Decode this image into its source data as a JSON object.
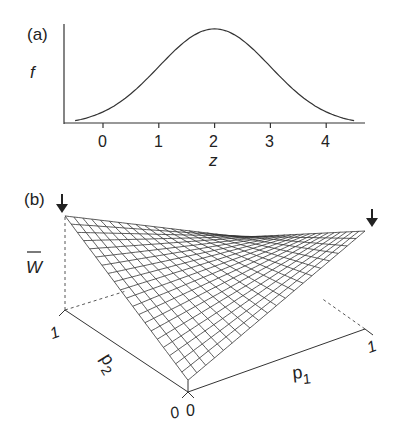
{
  "chart_data": [
    {
      "panel": "(a)",
      "type": "line",
      "title": "",
      "xlabel": "z",
      "ylabel": "f",
      "xticks": [
        "0",
        "1",
        "2",
        "3",
        "4"
      ],
      "xlim": [
        -0.5,
        4.5
      ],
      "grid": false,
      "series": [
        {
          "name": "f(z)",
          "shape": "gaussian",
          "mean": 2,
          "sd": 1,
          "x": [
            -0.5,
            0,
            0.5,
            1,
            1.5,
            2,
            2.5,
            3,
            3.5,
            4,
            4.5
          ],
          "y": [
            0.044,
            0.135,
            0.325,
            0.607,
            0.882,
            1.0,
            0.882,
            0.607,
            0.325,
            0.135,
            0.044
          ]
        }
      ]
    },
    {
      "panel": "(b)",
      "type": "surface",
      "zlabel": "W̄",
      "xlabel": "p1",
      "ylabel": "p2",
      "x_ticks": [
        "0",
        "1"
      ],
      "y_ticks": [
        "0",
        "1"
      ],
      "corners": {
        "p1=0,p2=0": 0.12,
        "p1=1,p2=0": 1.0,
        "p1=0,p2=1": 0.96,
        "p1=1,p2=1": 0.1
      },
      "grid_divisions": 20,
      "annotations": [
        "arrow at p1=0,p2=1 peak",
        "arrow at p1=1,p2=0 peak"
      ]
    }
  ],
  "labels": {
    "panel_a": "(a)",
    "panel_b": "(b)",
    "f": "f",
    "z": "z",
    "w": "W",
    "p1_base": "p",
    "p1_sub": "1",
    "p2_base": "p",
    "p2_sub": "2",
    "tick0": "0",
    "tick1": "1",
    "tick2": "2",
    "tick3": "3",
    "tick4": "4",
    "b_one_left": "1",
    "b_one_right": "1",
    "b_zero_left": "0",
    "b_zero_right": "0"
  }
}
